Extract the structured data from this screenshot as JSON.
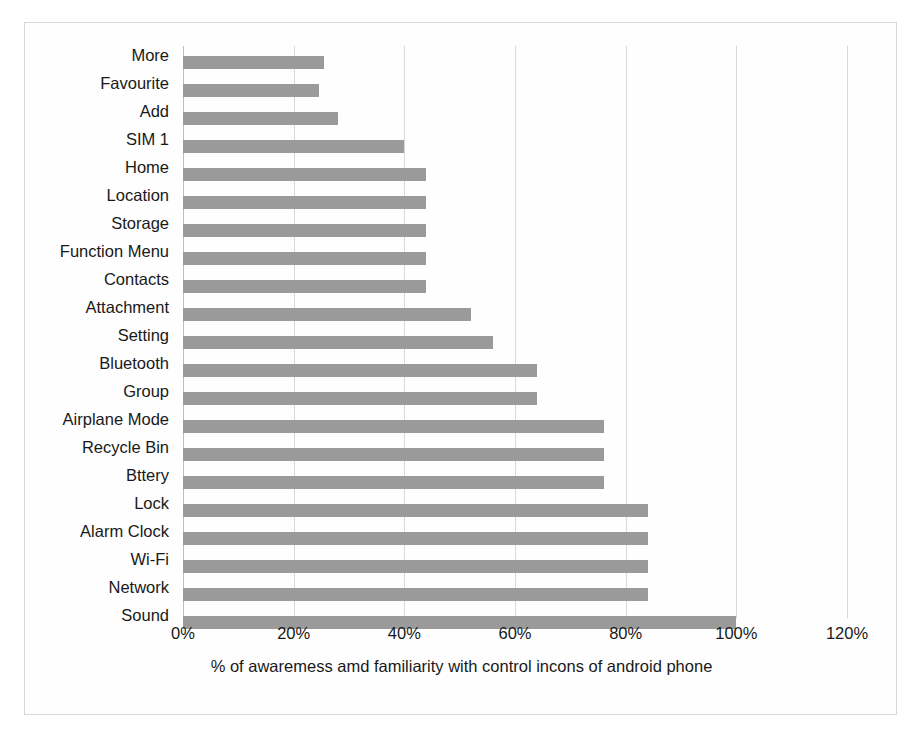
{
  "chart_data": {
    "type": "bar",
    "orientation": "horizontal",
    "title": "",
    "xlabel": "% of awaremess amd familiarity with control incons of android phone",
    "ylabel": "",
    "xlim": [
      0,
      120
    ],
    "xticks": [
      "0%",
      "20%",
      "40%",
      "60%",
      "80%",
      "100%",
      "120%"
    ],
    "xtick_values": [
      0,
      20,
      40,
      60,
      80,
      100,
      120
    ],
    "grid": true,
    "legend": false,
    "bar_color": "#9a9a9a",
    "categories": [
      "More",
      "Favourite",
      "Add",
      "SIM 1",
      "Home",
      "Location",
      "Storage",
      "Function Menu",
      "Contacts",
      "Attachment",
      "Setting",
      "Bluetooth",
      "Group",
      "Airplane Mode",
      "Recycle Bin",
      "Bttery",
      "Lock",
      "Alarm Clock",
      "Wi-Fi",
      "Network",
      "Sound"
    ],
    "values": [
      25.5,
      24.5,
      28,
      40,
      44,
      44,
      44,
      44,
      44,
      52,
      56,
      64,
      64,
      76,
      76,
      76,
      84,
      84,
      84,
      84,
      100
    ]
  }
}
